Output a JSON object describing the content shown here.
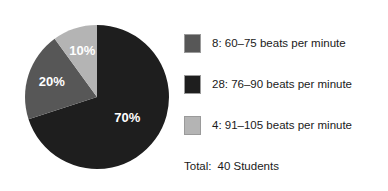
{
  "chart_data": {
    "type": "pie",
    "title": "",
    "xlabel": "",
    "ylabel": "",
    "categories": [
      "60–75 beats per minute",
      "76–90 beats per minute",
      "91–105 beats per minute"
    ],
    "values": [
      8,
      28,
      4
    ],
    "percentages": [
      20,
      70,
      10
    ],
    "slice_labels": [
      "20%",
      "70%",
      "10%"
    ],
    "colors": [
      "#575757",
      "#1e1e1e",
      "#b4b4b4"
    ],
    "legend_position": "right",
    "grid": false,
    "total_label": "Total:",
    "total_value": "40 Students",
    "start_angle_deg": 0,
    "direction": "clockwise",
    "draw_order": [
      {
        "label": "70%",
        "percent": 70,
        "color": "#1e1e1e",
        "start_deg": 0,
        "end_deg": 252
      },
      {
        "label": "20%",
        "percent": 20,
        "color": "#575757",
        "start_deg": 252,
        "end_deg": 324
      },
      {
        "label": "10%",
        "percent": 10,
        "color": "#b4b4b4",
        "start_deg": 324,
        "end_deg": 360
      }
    ]
  },
  "legend": {
    "items": [
      {
        "swatch_color": "#575757",
        "text": "8: 60–75 beats per minute"
      },
      {
        "swatch_color": "#1e1e1e",
        "text": "28: 76–90 beats per minute"
      },
      {
        "swatch_color": "#b4b4b4",
        "text": "4: 91–105 beats per minute"
      }
    ]
  },
  "footer": {
    "total_label": "Total:",
    "total_value": "40 Students"
  }
}
